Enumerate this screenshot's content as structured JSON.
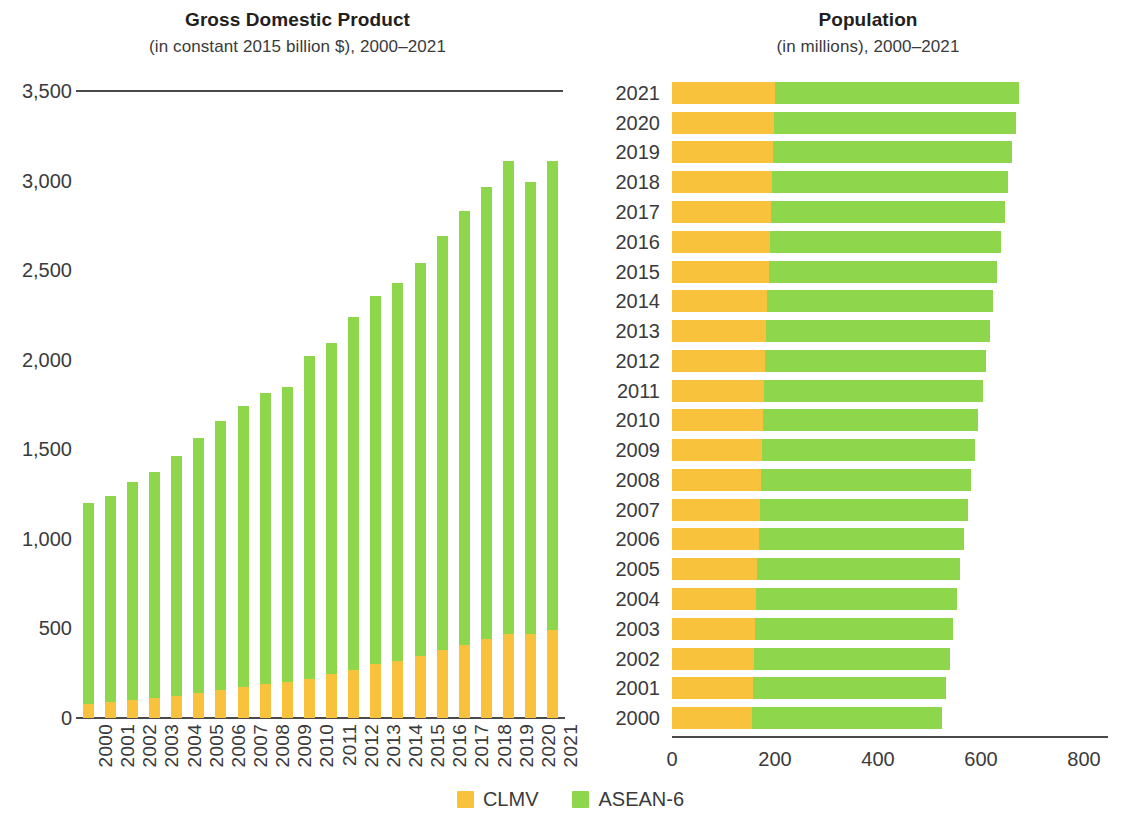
{
  "gdp": {
    "title": "Gross Domestic Product",
    "subtitle": "(in constant 2015 billion $), 2000–2021"
  },
  "population": {
    "title": "Population",
    "subtitle": "(in millions), 2000–2021"
  },
  "legend": {
    "items": [
      {
        "label": "CLMV",
        "color": "#f9c23c"
      },
      {
        "label": "ASEAN-6",
        "color": "#8ed64b"
      }
    ]
  },
  "colors": {
    "clmv": "#f9c23c",
    "asean6": "#8ed64b",
    "axis": "#4a4a4c",
    "text": "#3a3a3c"
  },
  "chart_data": [
    {
      "type": "bar",
      "orientation": "vertical",
      "stacked": true,
      "title": "Gross Domestic Product",
      "subtitle": "(in constant 2015 billion $), 2000–2021",
      "xlabel": "",
      "ylabel": "",
      "ylim": [
        0,
        3500
      ],
      "yticks": [
        0,
        500,
        1000,
        1500,
        2000,
        2500,
        3000,
        3500
      ],
      "ytick_labels": [
        "0",
        "500",
        "1,000",
        "1,500",
        "2,000",
        "2,500",
        "3,000",
        "3,500"
      ],
      "grid": false,
      "legend_position": "bottom",
      "categories": [
        "2000",
        "2001",
        "2002",
        "2003",
        "2004",
        "2005",
        "2006",
        "2007",
        "2008",
        "2009",
        "2010",
        "2011",
        "2012",
        "2013",
        "2014",
        "2015",
        "2016",
        "2017",
        "2018",
        "2019",
        "2020",
        "2021"
      ],
      "series": [
        {
          "name": "CLMV",
          "color": "#f9c23c",
          "values": [
            80,
            90,
            100,
            110,
            125,
            140,
            155,
            175,
            190,
            200,
            220,
            245,
            270,
            300,
            320,
            345,
            380,
            410,
            440,
            470,
            470,
            490
          ]
        },
        {
          "name": "ASEAN-6",
          "color": "#8ed64b",
          "values": [
            1120,
            1150,
            1220,
            1265,
            1340,
            1425,
            1505,
            1565,
            1625,
            1650,
            1800,
            1850,
            1970,
            2055,
            2110,
            2195,
            2310,
            2420,
            2525,
            2640,
            2520,
            2620
          ]
        }
      ],
      "totals": [
        1200,
        1240,
        1320,
        1375,
        1465,
        1565,
        1660,
        1740,
        1815,
        1850,
        2020,
        2095,
        2240,
        2355,
        2430,
        2540,
        2690,
        2830,
        2965,
        3110,
        2990,
        3110
      ]
    },
    {
      "type": "bar",
      "orientation": "horizontal",
      "stacked": true,
      "title": "Population",
      "subtitle": "(in millions), 2000–2021",
      "xlabel": "",
      "ylabel": "",
      "xlim": [
        0,
        800
      ],
      "xticks": [
        0,
        200,
        400,
        600,
        800
      ],
      "xtick_labels": [
        "0",
        "200",
        "400",
        "600",
        "800"
      ],
      "grid": false,
      "legend_position": "bottom",
      "categories": [
        "2021",
        "2020",
        "2019",
        "2018",
        "2017",
        "2016",
        "2015",
        "2014",
        "2013",
        "2012",
        "2011",
        "2010",
        "2009",
        "2008",
        "2007",
        "2006",
        "2005",
        "2004",
        "2003",
        "2002",
        "2001",
        "2000"
      ],
      "series": [
        {
          "name": "CLMV",
          "color": "#f9c23c",
          "values": [
            200,
            198,
            196,
            194,
            192,
            190,
            188,
            185,
            183,
            181,
            179,
            176,
            174,
            172,
            170,
            168,
            166,
            164,
            162,
            160,
            158,
            156
          ]
        },
        {
          "name": "ASEAN-6",
          "color": "#8ed64b",
          "values": [
            473,
            469,
            464,
            459,
            454,
            449,
            444,
            439,
            434,
            429,
            424,
            419,
            414,
            409,
            404,
            399,
            394,
            389,
            384,
            379,
            374,
            369
          ]
        }
      ],
      "totals": [
        673,
        667,
        660,
        653,
        646,
        639,
        632,
        624,
        617,
        610,
        603,
        595,
        588,
        581,
        574,
        567,
        560,
        553,
        546,
        539,
        532,
        525
      ]
    }
  ]
}
